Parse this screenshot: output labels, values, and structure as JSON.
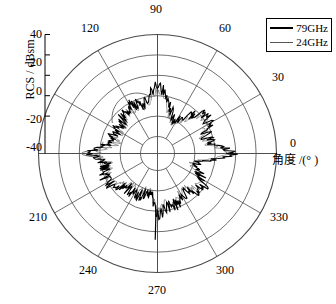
{
  "chart_data": {
    "type": "line",
    "projection": "polar",
    "title": "",
    "xlabel": "角度 /(° )",
    "ylabel": "RCS / dBsm",
    "angle_unit": "degree",
    "angle_ticks": [
      "0",
      "30",
      "60",
      "90",
      "120",
      "150",
      "180",
      "210",
      "240",
      "270",
      "300",
      "330"
    ],
    "angle_ticks_shown": [
      "0",
      "30",
      "60",
      "90",
      "120",
      "210",
      "240",
      "270",
      "300",
      "330"
    ],
    "radial_ticks": [
      "40",
      "20",
      "0",
      "-20",
      "-40"
    ],
    "rlim": [
      -60,
      40
    ],
    "r_tick_values": [
      40,
      20,
      0,
      -20,
      -40
    ],
    "grid": true,
    "grid_rings": 5,
    "grid_spokes": 12,
    "legend_position": "top-right",
    "series": [
      {
        "name": "79GHz",
        "color": "#000000",
        "linewidth": 1.1,
        "values": [
          -7,
          -12,
          -20,
          -26,
          -21,
          -15,
          -24,
          -30,
          -27,
          -18,
          -9,
          -16,
          -24,
          -19,
          -13,
          -22,
          -28,
          -23,
          -16,
          -10,
          -18,
          -25,
          -21,
          -14,
          -8,
          -17,
          -23,
          -19,
          -12,
          -20,
          -26,
          -22,
          -15,
          -9,
          -18,
          -24,
          -20,
          -13,
          -21,
          -27,
          -23,
          -16,
          -10,
          -19,
          -25,
          -21,
          -14,
          -22,
          -28,
          -24,
          -17,
          -11,
          -20,
          -26,
          -22,
          -15,
          -23,
          -29,
          -25,
          -18,
          -12,
          -21,
          -27,
          -23,
          -16,
          -24,
          -30,
          -26,
          -19,
          -13,
          -22,
          -28,
          -24,
          -17,
          -25,
          -31,
          -27,
          -20,
          -14,
          -23,
          -29,
          -25,
          -18,
          -26,
          -32,
          -28,
          -21,
          -15,
          -24,
          -30,
          -26,
          -19,
          -27,
          -33,
          -29,
          -22,
          -16,
          -25,
          -31,
          -27,
          -20,
          -14,
          -23,
          -29,
          -25,
          -18,
          -26,
          -32,
          -28,
          -21,
          -15,
          -24,
          -30,
          -26,
          -19,
          -27,
          -33,
          -29,
          -22,
          -16,
          -25,
          -31,
          -27,
          -20,
          -28,
          -34,
          -30,
          -23,
          -17,
          -26,
          -32,
          -28,
          -21,
          -29,
          -35,
          -31,
          -24,
          -18,
          -27,
          -33,
          -29,
          -22,
          -30,
          -36,
          -32,
          -25,
          -19,
          -28,
          -34,
          -30,
          -23,
          -31,
          -37,
          -33,
          -26,
          -20,
          -29,
          -35,
          -31,
          -24,
          -32,
          -38,
          -34,
          -27,
          -21,
          -30,
          -36,
          -32,
          -25,
          -33,
          -39,
          -35,
          -28,
          -22,
          -31,
          -37,
          -33,
          -26,
          -34,
          -40,
          -36,
          -29,
          -23,
          -32,
          -38,
          -34,
          -27,
          -21
        ]
      },
      {
        "name": "24GHz",
        "color": "#6e6e6e",
        "linewidth": 0.7,
        "values": [
          -10,
          -16,
          -24,
          -30,
          -25,
          -19,
          -28,
          -34,
          -31,
          -22,
          -14,
          -20,
          -28,
          -23,
          -17,
          -26,
          -32,
          -27,
          -20,
          -14,
          -22,
          -29,
          -25,
          -18,
          -12,
          -21,
          -27,
          -23,
          -16,
          -24,
          -30,
          -26,
          -19,
          -13,
          -22,
          -28,
          -24,
          -17,
          -25,
          -31,
          -27,
          -20,
          -14,
          -23,
          -29,
          -25,
          -18,
          -26,
          -32,
          -28,
          -21,
          -15,
          -24,
          -30,
          -26,
          -19,
          -27,
          -33,
          -29,
          -22,
          -16,
          -25,
          -31,
          -27,
          -20,
          -28,
          -34,
          -30,
          -23,
          -17,
          -26,
          -32,
          -28,
          -21,
          -29,
          -35,
          -31,
          -24,
          -18,
          -27,
          -33,
          -29,
          -22,
          -30,
          -36,
          -32,
          -25,
          -19,
          -28,
          -34,
          -30,
          -23,
          -31,
          -37,
          -33,
          -26,
          -20,
          -29,
          -35,
          -31,
          -24,
          -18,
          -27,
          -33,
          -29,
          -22,
          -30,
          -36,
          -32,
          -25,
          -19,
          -28,
          -34,
          -30,
          -23,
          -31,
          -37,
          -33,
          -26,
          -20,
          -29,
          -35,
          -31,
          -24,
          -32,
          -38,
          -34,
          -27,
          -21,
          -30,
          -36,
          -32,
          -25,
          -33,
          -39,
          -35,
          -28,
          -22,
          -31,
          -37,
          -33,
          -26,
          -34,
          -40,
          -36,
          -29,
          -23,
          -32,
          -38,
          -34,
          -27,
          -35,
          -41,
          -37,
          -30,
          -24,
          -33,
          -39,
          -35,
          -28,
          -36,
          -42,
          -38,
          -31,
          -25,
          -34,
          -40,
          -36,
          -29,
          -37,
          -43,
          -39,
          -32,
          -26,
          -35,
          -41,
          -37,
          -30,
          -38,
          -44,
          -40,
          -33,
          -27,
          -36,
          -42,
          -38,
          -31,
          -25
        ]
      }
    ]
  },
  "axes": {
    "radial_label": "RCS / dBsm",
    "angular_label": "角度 /(° )",
    "zero_tick": "0",
    "radial_tick_labels": [
      "40",
      "20",
      "0",
      "-20",
      "-40"
    ],
    "angular_tick_labels": {
      "a90": "90",
      "a120": "120",
      "a60": "60",
      "a30": "30",
      "a0": "0",
      "a330": "330",
      "a300": "300",
      "a270": "270",
      "a240": "240",
      "a210": "210"
    }
  },
  "legend": {
    "items": [
      {
        "label": "79GHz",
        "color": "#000000"
      },
      {
        "label": "24GHz",
        "color": "#6e6e6e"
      }
    ]
  },
  "colors": {
    "series_79ghz": "#000000",
    "series_24ghz": "#6e6e6e",
    "grid": "#4a4a4a",
    "axis": "#000000",
    "background": "#ffffff"
  }
}
